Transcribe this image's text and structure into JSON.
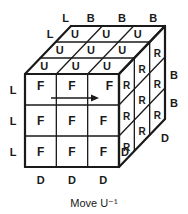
{
  "diagram": {
    "caption": "Move U⁻¹",
    "stroke_color": "#1a1a1a",
    "background": "#ffffff",
    "faces": {
      "front": {
        "label": "F",
        "cells": [
          [
            "F",
            "F",
            "F"
          ],
          [
            "F",
            "F",
            "F"
          ],
          [
            "F",
            "F",
            "F"
          ]
        ]
      },
      "up": {
        "label": "U",
        "cells": [
          [
            "U",
            "U",
            "U"
          ],
          [
            "U",
            "U",
            "U"
          ],
          [
            "U",
            "U",
            "U"
          ]
        ]
      },
      "right": {
        "label": "R",
        "cells": [
          [
            "R",
            "R",
            "R"
          ],
          [
            "R",
            "R",
            "R"
          ],
          [
            "R",
            "R",
            "R"
          ]
        ]
      }
    },
    "edge_labels": {
      "left_of_front": [
        "L",
        "L",
        "L"
      ],
      "below_front": [
        "D",
        "D",
        "D"
      ],
      "left_of_up": [
        "L",
        "L"
      ],
      "behind_up": [
        "B",
        "B",
        "B"
      ],
      "right_of_right": [
        "B",
        "B"
      ],
      "below_right": [
        "D",
        "D"
      ]
    },
    "arrow": {
      "description": "arrow on top row of front face pointing right",
      "direction": "right"
    }
  }
}
